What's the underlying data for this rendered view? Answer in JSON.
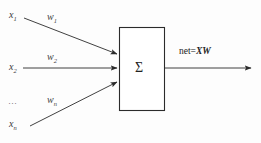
{
  "diagram": {
    "background_color": "#fdfdfd",
    "stroke_color": "#2b2b2b",
    "inputs": [
      {
        "id": "x1",
        "variable": "x",
        "subscript": "1",
        "weight_variable": "w",
        "weight_subscript": "1"
      },
      {
        "id": "x2",
        "variable": "x",
        "subscript": "2",
        "weight_variable": "w",
        "weight_subscript": "2"
      },
      {
        "id": "xn",
        "variable": "x",
        "subscript": "n",
        "weight_variable": "w",
        "weight_subscript": "n"
      }
    ],
    "ellipsis": "…",
    "processing_unit": {
      "symbol": "Σ",
      "shape": "rectangle"
    },
    "output": {
      "prefix": "net=",
      "expression": "XW"
    }
  }
}
